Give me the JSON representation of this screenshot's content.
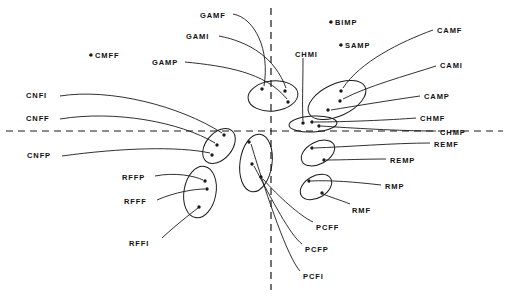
{
  "figure": {
    "type": "scatter-cluster-diagram",
    "width": 509,
    "height": 301,
    "background": "#ffffff",
    "ink_color": "#1a1a1a",
    "axes": {
      "style": "dashed",
      "horizontal": {
        "y": 131,
        "x_start": 6,
        "x_end": 503
      },
      "vertical": {
        "x": 271,
        "y_start": 8,
        "y_end": 290
      }
    }
  },
  "labels": [
    {
      "id": "GAMF",
      "text": "GAMF",
      "x": 200,
      "y": 12,
      "starred": false
    },
    {
      "id": "GAMI",
      "text": "GAMI",
      "x": 186,
      "y": 33,
      "starred": false
    },
    {
      "id": "GAMP",
      "text": "GAMP",
      "x": 152,
      "y": 59,
      "starred": false
    },
    {
      "id": "CMFF",
      "text": "CMFF",
      "x": 89,
      "y": 52,
      "starred": true
    },
    {
      "id": "BIMP",
      "text": "BIMP",
      "x": 329,
      "y": 19,
      "starred": true
    },
    {
      "id": "SAMP",
      "text": "SAMP",
      "x": 339,
      "y": 42,
      "starred": true
    },
    {
      "id": "CHMI",
      "text": "CHMI",
      "x": 295,
      "y": 51,
      "starred": false
    },
    {
      "id": "CAMF",
      "text": "CAMF",
      "x": 437,
      "y": 27,
      "starred": false
    },
    {
      "id": "CAMI",
      "text": "CAMI",
      "x": 440,
      "y": 62,
      "starred": false
    },
    {
      "id": "CAMP",
      "text": "CAMP",
      "x": 424,
      "y": 93,
      "starred": false
    },
    {
      "id": "CHMF",
      "text": "CHMF",
      "x": 420,
      "y": 115,
      "starred": false
    },
    {
      "id": "CHMP",
      "text": "CHMP",
      "x": 440,
      "y": 129,
      "starred": false
    },
    {
      "id": "REMF",
      "text": "REMF",
      "x": 434,
      "y": 141,
      "starred": false
    },
    {
      "id": "REMP",
      "text": "REMP",
      "x": 390,
      "y": 157,
      "starred": false
    },
    {
      "id": "RMP",
      "text": "RMP",
      "x": 385,
      "y": 183,
      "starred": false
    },
    {
      "id": "RMF",
      "text": "RMF",
      "x": 352,
      "y": 207,
      "starred": false
    },
    {
      "id": "PCFF",
      "text": "PCFF",
      "x": 316,
      "y": 224,
      "starred": false
    },
    {
      "id": "PCFP",
      "text": "PCFP",
      "x": 305,
      "y": 246,
      "starred": false
    },
    {
      "id": "PCFI",
      "text": "PCFI",
      "x": 303,
      "y": 273,
      "starred": false
    },
    {
      "id": "CNFI",
      "text": "CNFI",
      "x": 26,
      "y": 92,
      "starred": false
    },
    {
      "id": "CNFF",
      "text": "CNFF",
      "x": 26,
      "y": 115,
      "starred": false
    },
    {
      "id": "CNFP",
      "text": "CNFP",
      "x": 27,
      "y": 152,
      "starred": false
    },
    {
      "id": "RFFP",
      "text": "RFFP",
      "x": 122,
      "y": 174,
      "starred": false
    },
    {
      "id": "RFFF",
      "text": "RFFF",
      "x": 124,
      "y": 198,
      "starred": false
    },
    {
      "id": "RFFI",
      "text": "RFFI",
      "x": 129,
      "y": 240,
      "starred": false
    }
  ],
  "clusters": [
    {
      "id": "GAM",
      "cx": 273,
      "cy": 96,
      "rx": 25,
      "ry": 15,
      "rot": -6,
      "n_points": 3
    },
    {
      "id": "CAM",
      "cx": 337,
      "cy": 100,
      "rx": 31,
      "ry": 16,
      "rot": -25,
      "n_points": 3
    },
    {
      "id": "CHM",
      "cx": 313,
      "cy": 124,
      "rx": 24,
      "ry": 8,
      "rot": -3,
      "n_points": 3
    },
    {
      "id": "CNF",
      "cx": 219,
      "cy": 146,
      "rx": 20,
      "ry": 13,
      "rot": -50,
      "n_points": 3
    },
    {
      "id": "PCF",
      "cx": 256,
      "cy": 163,
      "rx": 16,
      "ry": 29,
      "rot": 8,
      "n_points": 3
    },
    {
      "id": "REM",
      "cx": 318,
      "cy": 153,
      "rx": 18,
      "ry": 11,
      "rot": -28,
      "n_points": 2
    },
    {
      "id": "RM",
      "cx": 316,
      "cy": 187,
      "rx": 17,
      "ry": 11,
      "rot": -30,
      "n_points": 2
    },
    {
      "id": "RFF",
      "cx": 200,
      "cy": 192,
      "rx": 16,
      "ry": 26,
      "rot": 10,
      "n_points": 3
    }
  ],
  "points": [
    {
      "id": "GAMF-pt",
      "x": 262,
      "y": 89
    },
    {
      "id": "GAMI-pt",
      "x": 285,
      "y": 91
    },
    {
      "id": "GAMP-pt",
      "x": 288,
      "y": 102
    },
    {
      "id": "CAMF-pt",
      "x": 341,
      "y": 91
    },
    {
      "id": "CAMI-pt",
      "x": 340,
      "y": 101
    },
    {
      "id": "CAMP-pt",
      "x": 328,
      "y": 110
    },
    {
      "id": "CHMI-pt",
      "x": 303,
      "y": 123
    },
    {
      "id": "CHMF-pt",
      "x": 312,
      "y": 122
    },
    {
      "id": "CHMP-pt",
      "x": 319,
      "y": 126
    },
    {
      "id": "CNFI-pt",
      "x": 224,
      "y": 135
    },
    {
      "id": "CNFF-pt",
      "x": 217,
      "y": 145
    },
    {
      "id": "CNFP-pt",
      "x": 212,
      "y": 155
    },
    {
      "id": "PCFF-pt",
      "x": 249,
      "y": 142
    },
    {
      "id": "PCFP-pt",
      "x": 252,
      "y": 164
    },
    {
      "id": "PCFI-pt",
      "x": 261,
      "y": 177
    },
    {
      "id": "REMF-pt",
      "x": 312,
      "y": 148
    },
    {
      "id": "REMP-pt",
      "x": 324,
      "y": 160
    },
    {
      "id": "RMP-pt",
      "x": 309,
      "y": 181
    },
    {
      "id": "RMF-pt",
      "x": 322,
      "y": 193
    },
    {
      "id": "RFFP-pt",
      "x": 205,
      "y": 181
    },
    {
      "id": "RFFF-pt",
      "x": 207,
      "y": 189
    },
    {
      "id": "RFFI-pt",
      "x": 199,
      "y": 207
    },
    {
      "id": "CMFF-pt",
      "x": 91,
      "y": 55
    },
    {
      "id": "BIMP-pt",
      "x": 331,
      "y": 22
    },
    {
      "id": "SAMP-pt",
      "x": 341,
      "y": 45
    }
  ],
  "leaders": [
    {
      "id": "GAMF-leader",
      "d": "M 233 14 C 255 18, 270 50, 264 86"
    },
    {
      "id": "GAMI-leader",
      "d": "M 219 36 C 250 42, 275 58, 286 88"
    },
    {
      "id": "GAMP-leader",
      "d": "M 185 62 C 225 66, 265 72, 287 99"
    },
    {
      "id": "CAMF-leader",
      "d": "M 433 30 C 400 42, 360 62, 343 88"
    },
    {
      "id": "CAMI-leader",
      "d": "M 436 66 C 405 76, 368 86, 343 99"
    },
    {
      "id": "CAMP-leader",
      "d": "M 420 96 C 392 100, 355 106, 331 110"
    },
    {
      "id": "CHMF-leader",
      "d": "M 416 118 C 390 120, 345 122, 314 122"
    },
    {
      "id": "CHMP-leader",
      "d": "M 436 131 C 400 131, 350 128, 321 126"
    },
    {
      "id": "REMF-leader",
      "d": "M 430 143 C 395 143, 345 147, 314 148"
    },
    {
      "id": "REMP-leader",
      "d": "M 386 159 C 365 159, 342 160, 326 160"
    },
    {
      "id": "RMP-leader",
      "d": "M 381 185 C 355 182, 330 180, 311 181"
    },
    {
      "id": "RMF-leader",
      "d": "M 350 204 C 340 200, 330 197, 323 194"
    },
    {
      "id": "PCFF-leader",
      "d": "M 313 222 C 300 216, 278 196, 263 179"
    },
    {
      "id": "PCFP-leader",
      "d": "M 302 244 C 290 235, 272 200, 254 166"
    },
    {
      "id": "PCFI-leader",
      "d": "M 300 271 C 288 258, 268 200, 251 144"
    },
    {
      "id": "CHMI-leader",
      "d": "M 303 58 C 303 85, 302 105, 303 121"
    },
    {
      "id": "CNFI-leader",
      "d": "M 60 96 C 110 88, 180 106, 222 133"
    },
    {
      "id": "CNFF-leader",
      "d": "M 60 119 C 115 110, 180 122, 215 143"
    },
    {
      "id": "CNFP-leader",
      "d": "M 62 156 C 120 148, 178 146, 210 153"
    },
    {
      "id": "RFFP-leader",
      "d": "M 155 176 C 175 172, 195 176, 203 180"
    },
    {
      "id": "RFFF-leader",
      "d": "M 157 200 C 175 192, 195 189, 205 189"
    },
    {
      "id": "RFFI-leader",
      "d": "M 162 238 C 175 226, 190 214, 198 208"
    }
  ]
}
